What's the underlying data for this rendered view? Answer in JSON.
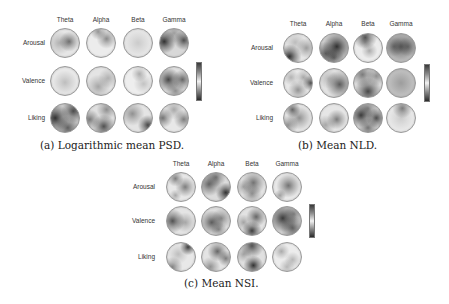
{
  "columns": [
    "Theta",
    "Alpha",
    "Beta",
    "Gamma"
  ],
  "rows": [
    "Arousal",
    "Valence",
    "Liking"
  ],
  "panels": [
    {
      "id": "a",
      "caption": "(a) Logarithmic mean PSD.",
      "caption_pos": [
        40,
        139
      ],
      "col_x": [
        50,
        86,
        123,
        159
      ],
      "row_y": [
        28,
        66,
        103
      ],
      "col_label_y": 16,
      "row_label_right": 45,
      "colorbar": {
        "x": 196,
        "y": 62,
        "h": 37
      },
      "maps": [
        [
          {
            "bg": "#e6e6e6",
            "blobs": [
              [
                65,
                45,
                0.55,
                10
              ],
              [
                30,
                50,
                0.25,
                12
              ]
            ]
          },
          {
            "bg": "#ececec",
            "blobs": [
              [
                70,
                35,
                0.45,
                10
              ],
              [
                40,
                10,
                0.4,
                8
              ]
            ]
          },
          {
            "bg": "#ebebeb",
            "blobs": [
              [
                50,
                50,
                0.15,
                15
              ]
            ]
          },
          {
            "bg": "#d8d8d8",
            "blobs": [
              [
                15,
                45,
                0.85,
                12
              ],
              [
                85,
                40,
                0.7,
                10
              ],
              [
                50,
                15,
                0.3,
                10
              ]
            ]
          }
        ],
        [
          {
            "bg": "#e8e8e8",
            "blobs": [
              [
                50,
                55,
                0.2,
                12
              ]
            ]
          },
          {
            "bg": "#e4e4e4",
            "blobs": [
              [
                40,
                70,
                0.3,
                12
              ],
              [
                75,
                40,
                0.25,
                10
              ]
            ]
          },
          {
            "bg": "#eeeeee",
            "blobs": [
              [
                55,
                25,
                0.3,
                8
              ],
              [
                70,
                60,
                0.2,
                10
              ]
            ]
          },
          {
            "bg": "#e0e0e0",
            "blobs": [
              [
                30,
                45,
                0.75,
                12
              ],
              [
                80,
                45,
                0.6,
                10
              ],
              [
                55,
                85,
                0.4,
                10
              ]
            ]
          }
        ],
        [
          {
            "bg": "#d0d0d0",
            "blobs": [
              [
                15,
                50,
                0.85,
                14
              ],
              [
                80,
                25,
                0.7,
                12
              ],
              [
                60,
                85,
                0.6,
                12
              ]
            ]
          },
          {
            "bg": "#e0e0e0",
            "blobs": [
              [
                60,
                80,
                0.7,
                12
              ],
              [
                10,
                55,
                0.5,
                10
              ],
              [
                70,
                20,
                0.4,
                10
              ]
            ]
          },
          {
            "bg": "#e4e4e4",
            "blobs": [
              [
                85,
                75,
                0.75,
                10
              ],
              [
                30,
                35,
                0.4,
                12
              ]
            ]
          },
          {
            "bg": "#e8e8e8",
            "blobs": [
              [
                10,
                50,
                0.55,
                10
              ],
              [
                85,
                55,
                0.5,
                10
              ],
              [
                50,
                20,
                0.3,
                10
              ]
            ]
          }
        ]
      ]
    },
    {
      "id": "b",
      "caption": "(b) Mean NLD.",
      "caption_pos": [
        298,
        139
      ],
      "col_x": [
        283,
        319,
        353,
        386
      ],
      "row_y": [
        33,
        68,
        103
      ],
      "col_label_y": 20,
      "row_label_right": 273,
      "colorbar": {
        "x": 424,
        "y": 64,
        "h": 36
      },
      "maps": [
        [
          {
            "bg": "#e6e6e6",
            "blobs": [
              [
                20,
                80,
                0.85,
                12
              ],
              [
                80,
                50,
                0.35,
                10
              ],
              [
                40,
                30,
                0.2,
                10
              ]
            ]
          },
          {
            "bg": "#cfcfcf",
            "blobs": [
              [
                60,
                45,
                0.85,
                14
              ],
              [
                20,
                70,
                0.6,
                12
              ],
              [
                50,
                85,
                0.5,
                10
              ]
            ]
          },
          {
            "bg": "#ececec",
            "blobs": [
              [
                40,
                12,
                0.7,
                12
              ],
              [
                55,
                60,
                0.3,
                8
              ],
              [
                40,
                30,
                0.2,
                6
              ]
            ]
          },
          {
            "bg": "#dcdcdc",
            "blobs": [
              [
                50,
                45,
                0.6,
                20
              ],
              [
                25,
                45,
                0.4,
                10
              ],
              [
                75,
                45,
                0.4,
                10
              ]
            ]
          }
        ],
        [
          {
            "bg": "#e8e8e8",
            "blobs": [
              [
                95,
                50,
                0.7,
                8
              ],
              [
                50,
                75,
                0.4,
                10
              ],
              [
                70,
                30,
                0.3,
                8
              ],
              [
                25,
                30,
                0.25,
                8
              ]
            ]
          },
          {
            "bg": "#e2e2e2",
            "blobs": [
              [
                70,
                55,
                0.65,
                14
              ],
              [
                30,
                35,
                0.2,
                10
              ]
            ]
          },
          {
            "bg": "#e2e2e2",
            "blobs": [
              [
                50,
                80,
                0.75,
                14
              ],
              [
                30,
                20,
                0.5,
                12
              ],
              [
                80,
                25,
                0.4,
                10
              ]
            ]
          },
          {
            "bg": "#d8d8d8",
            "blobs": [
              [
                50,
                50,
                0.3,
                24
              ]
            ]
          }
        ],
        [
          {
            "bg": "#e6e6e6",
            "blobs": [
              [
                30,
                20,
                0.6,
                8
              ],
              [
                55,
                50,
                0.4,
                12
              ],
              [
                15,
                75,
                0.4,
                10
              ]
            ]
          },
          {
            "bg": "#e6e6e6",
            "blobs": [
              [
                60,
                55,
                0.5,
                10
              ],
              [
                20,
                75,
                0.3,
                10
              ]
            ]
          },
          {
            "bg": "#d6d6d6",
            "blobs": [
              [
                25,
                40,
                0.8,
                12
              ],
              [
                80,
                50,
                0.7,
                10
              ],
              [
                50,
                85,
                0.5,
                10
              ],
              [
                50,
                15,
                0.4,
                10
              ]
            ]
          },
          {
            "bg": "#ececec",
            "blobs": [
              [
                55,
                15,
                0.5,
                10
              ],
              [
                50,
                50,
                0.15,
                14
              ]
            ]
          }
        ]
      ]
    },
    {
      "id": "c",
      "caption": "(c) Mean NSI.",
      "caption_pos": [
        184,
        277
      ],
      "col_x": [
        166,
        201,
        237,
        272
      ],
      "row_y": [
        172,
        206,
        242
      ],
      "col_label_y": 160,
      "row_label_right": 155,
      "colorbar": {
        "x": 309,
        "y": 204,
        "h": 32
      },
      "maps": [
        [
          {
            "bg": "#e8e8e8",
            "blobs": [
              [
                30,
                20,
                0.5,
                8
              ],
              [
                65,
                50,
                0.5,
                10
              ],
              [
                30,
                80,
                0.3,
                6
              ]
            ]
          },
          {
            "bg": "#dcdcdc",
            "blobs": [
              [
                85,
                70,
                0.85,
                10
              ],
              [
                25,
                40,
                0.6,
                12
              ],
              [
                50,
                15,
                0.5,
                10
              ]
            ]
          },
          {
            "bg": "#e4e4e4",
            "blobs": [
              [
                55,
                35,
                0.55,
                12
              ],
              [
                50,
                75,
                0.4,
                10
              ],
              [
                20,
                50,
                0.3,
                8
              ]
            ]
          },
          {
            "bg": "#e8e8e8",
            "blobs": [
              [
                55,
                45,
                0.55,
                12
              ],
              [
                25,
                80,
                0.35,
                6
              ]
            ]
          }
        ],
        [
          {
            "bg": "#e4e4e4",
            "blobs": [
              [
                20,
                50,
                0.7,
                12
              ],
              [
                65,
                55,
                0.3,
                10
              ]
            ]
          },
          {
            "bg": "#dedede",
            "blobs": [
              [
                35,
                55,
                0.65,
                12
              ],
              [
                70,
                40,
                0.4,
                10
              ],
              [
                60,
                80,
                0.4,
                8
              ]
            ]
          },
          {
            "bg": "#e2e2e2",
            "blobs": [
              [
                50,
                85,
                0.8,
                10
              ],
              [
                65,
                35,
                0.6,
                10
              ],
              [
                20,
                55,
                0.3,
                8
              ]
            ]
          },
          {
            "bg": "#d4d4d4",
            "blobs": [
              [
                35,
                40,
                0.8,
                14
              ],
              [
                70,
                75,
                0.6,
                12
              ],
              [
                75,
                25,
                0.4,
                10
              ]
            ]
          }
        ],
        [
          {
            "bg": "#e8e8e8",
            "blobs": [
              [
                75,
                15,
                0.8,
                8
              ],
              [
                20,
                85,
                0.45,
                10
              ],
              [
                40,
                40,
                0.2,
                10
              ]
            ]
          },
          {
            "bg": "#e4e4e4",
            "blobs": [
              [
                55,
                30,
                0.6,
                10
              ],
              [
                85,
                55,
                0.5,
                8
              ],
              [
                30,
                85,
                0.4,
                10
              ]
            ]
          },
          {
            "bg": "#e0e0e0",
            "blobs": [
              [
                55,
                80,
                0.85,
                10
              ],
              [
                50,
                10,
                0.7,
                12
              ],
              [
                20,
                40,
                0.3,
                8
              ]
            ]
          },
          {
            "bg": "#ececec",
            "blobs": [
              [
                30,
                30,
                0.3,
                8
              ],
              [
                70,
                60,
                0.25,
                8
              ],
              [
                50,
                85,
                0.25,
                8
              ]
            ]
          }
        ]
      ]
    }
  ]
}
